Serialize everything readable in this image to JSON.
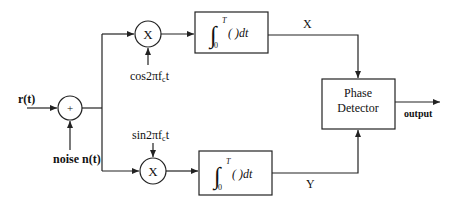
{
  "diagram": {
    "type": "block-diagram",
    "colors": {
      "stroke": "#222222",
      "background": "#ffffff",
      "text": "#111111"
    },
    "inputs": {
      "signal_label": "r(t)",
      "noise_label": "noise n(t)"
    },
    "adder": {
      "symbol": "+"
    },
    "upper_branch": {
      "multiplier_symbol": "X",
      "carrier_label": "cos2πf",
      "carrier_sub": "c",
      "carrier_suffix": "t",
      "integrator": {
        "integral": "∫",
        "upper_limit": "T",
        "lower_limit": "0",
        "body": "( )dt"
      },
      "output_label": "X"
    },
    "lower_branch": {
      "multiplier_symbol": "X",
      "carrier_label": "sin2πf",
      "carrier_sub": "c",
      "carrier_suffix": "t",
      "integrator": {
        "integral": "∫",
        "upper_limit": "T",
        "lower_limit": "0",
        "body": "( )dt"
      },
      "output_label": "Y"
    },
    "phase_detector": {
      "line1": "Phase",
      "line2": "Detector"
    },
    "output_label": "output"
  }
}
